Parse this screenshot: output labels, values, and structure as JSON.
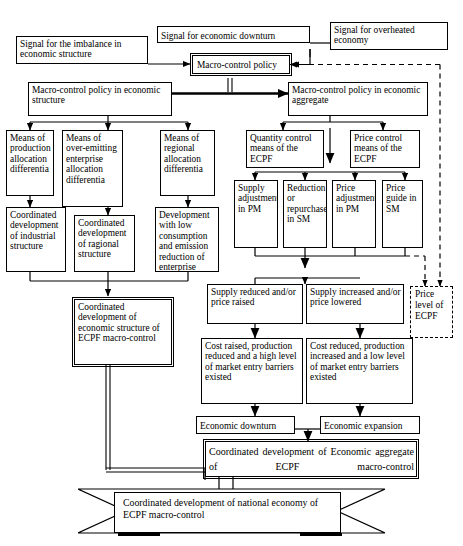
{
  "diagram": {
    "nodes": {
      "signal_imbalance": "Signal for the imbalance in economic structure",
      "signal_downturn": "Signal for economic downturn",
      "signal_overheated": "Signal for overheated economy",
      "macro_control_policy": "Macro-control policy",
      "mcp_structure": "Macro-control policy in economic structure",
      "mcp_aggregate": "Macro-control policy in economic aggregate",
      "means_production": "Means of production allocation differentia",
      "means_overemitting": "Means of over-emitting enterprise allocation differentia",
      "means_regional": "Means of regional allocation differentia",
      "coord_industrial": "Coordinated development of industrial structure",
      "coord_ragional": "Coordinated development of ragional structure",
      "dev_low_consumption": "Development with low consumption and emission reduction of enterprise",
      "quantity_control": "Quantity control means of the ECPF",
      "price_control": "Price control means of the ECPF",
      "supply_adjustment_pm": "Supply adjustment in PM",
      "reduction_repurchase_sm": "Reduction or repurchase in SM",
      "price_adjustment_pm": "Price adjustment in PM",
      "price_guide_sm": "Price guide in SM",
      "price_level_ecpf": "Price level of ECPF",
      "coord_econ_structure": "Coordinated development of economic structure of ECPF macro-control",
      "supply_reduced": "Supply reduced and/or price raised",
      "supply_increased": "Supply increased and/or price lowered",
      "cost_raised": "Cost raised, production reduced and a high level of market entry barriers existed",
      "cost_reduced": "Cost reduced, production increased and a low level of market entry barriers existed",
      "economic_downturn": "Economic downturn",
      "economic_expansion": "Economic expansion",
      "coord_econ_aggregate": "Coordinated development of Economic aggregate of ECPF macro-control",
      "coord_national": "Coordinated development of national economy of ECPF macro-control"
    },
    "colors": {
      "stroke": "#000000",
      "fill": "#ffffff"
    }
  }
}
